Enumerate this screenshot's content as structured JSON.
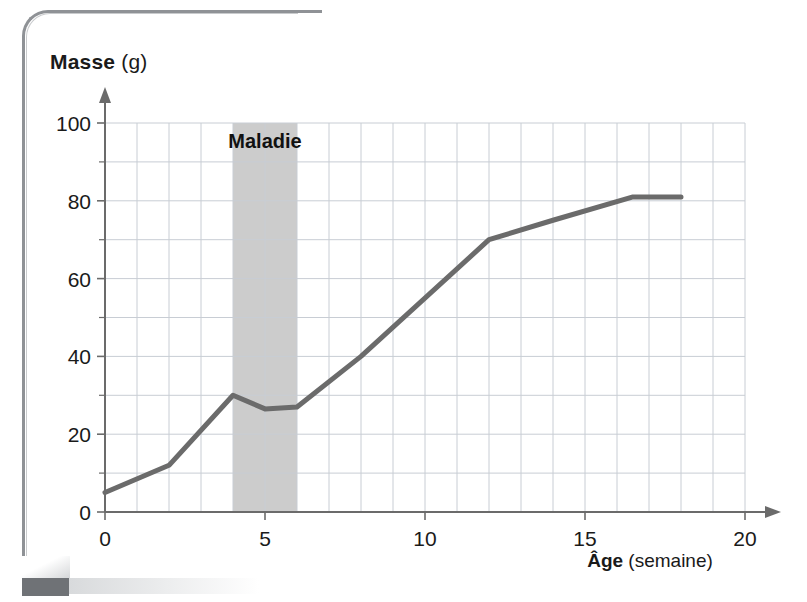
{
  "chart_data": {
    "type": "line",
    "title": "",
    "xlabel": "Âge (semaine)",
    "ylabel": "Masse (g)",
    "xlabel_strong": "Âge",
    "xlabel_light": "(semaine)",
    "ylabel_strong": "Masse",
    "ylabel_light": "(g)",
    "xlim": [
      0,
      20
    ],
    "ylim": [
      0,
      100
    ],
    "xticks": [
      0,
      5,
      10,
      15,
      20
    ],
    "xtick_labels": [
      "0",
      "5",
      "10",
      "15",
      "20"
    ],
    "yticks": [
      0,
      20,
      40,
      60,
      80,
      100
    ],
    "ytick_labels": [
      "0",
      "20",
      "40",
      "60",
      "80",
      "100"
    ],
    "x_minor_step": 1,
    "y_minor_step": 10,
    "grid": true,
    "legend": false,
    "series": [
      {
        "name": "Masse",
        "color": "#6b6b6b",
        "x": [
          0,
          2,
          4,
          5,
          6,
          8,
          12,
          14,
          16.5,
          18
        ],
        "y": [
          5,
          12,
          30,
          26.5,
          27,
          40,
          70,
          75,
          81,
          81
        ]
      }
    ],
    "annotations": [
      {
        "kind": "vertical-band",
        "label": "Maladie",
        "x_start": 4,
        "x_end": 6,
        "y_start": 0,
        "y_end": 100,
        "fill": "#cccccc",
        "label_y": 95
      }
    ]
  },
  "style": {
    "curve_color": "#6b6b6b",
    "axis_color": "#6b6b6b",
    "grid_color": "#c8cdd4",
    "band_color": "#cbcbcb",
    "text_color": "#1a1a1a",
    "background": "#ffffff"
  }
}
